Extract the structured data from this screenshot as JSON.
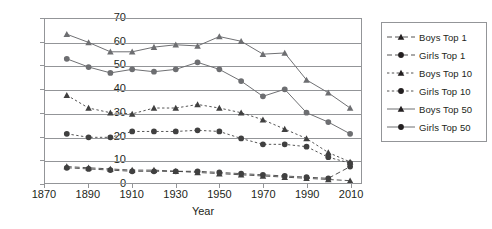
{
  "chart_data": {
    "type": "line",
    "title": "",
    "xlabel": "Year",
    "ylabel": "",
    "xlim": [
      1870,
      2015
    ],
    "ylim": [
      0,
      70
    ],
    "ytick_values": [
      0,
      10,
      20,
      30,
      40,
      50,
      60,
      70
    ],
    "xtick_values": [
      1870,
      1890,
      1910,
      1930,
      1950,
      1970,
      1990,
      2010
    ],
    "grid": "horizontal",
    "legend_position": "right",
    "x": [
      1880,
      1890,
      1900,
      1910,
      1920,
      1930,
      1940,
      1950,
      1960,
      1970,
      1980,
      1990,
      2000,
      2010
    ],
    "series": [
      {
        "name": "Boys Top 1",
        "marker": "triangle",
        "line_style": "dashed",
        "color": "#404040",
        "values": [
          7,
          6.5,
          6,
          5.5,
          5.5,
          5,
          4.5,
          4,
          3.5,
          3,
          2.5,
          2,
          1.5,
          1
        ]
      },
      {
        "name": "Girls Top 1",
        "marker": "circle",
        "line_style": "dashed",
        "color": "#404040",
        "values": [
          6.5,
          6,
          5.5,
          5,
          5,
          5,
          5,
          4.5,
          4,
          3.5,
          3,
          2.5,
          2,
          7
        ]
      },
      {
        "name": "Boys Top 10",
        "marker": "triangle",
        "line_style": "dotted",
        "color": "#404040",
        "values": [
          37.5,
          32,
          30,
          29.5,
          32,
          32,
          33.5,
          32,
          30,
          27,
          23,
          19,
          13,
          9
        ]
      },
      {
        "name": "Girls Top 10",
        "marker": "circle",
        "line_style": "dotted",
        "color": "#404040",
        "values": [
          21,
          19.5,
          19.5,
          22,
          22,
          22,
          22.5,
          22,
          19,
          16.5,
          16.5,
          15.5,
          11,
          8.5
        ]
      },
      {
        "name": "Boys Top 50",
        "marker": "triangle",
        "line_style": "solid",
        "color": "#6d6e71",
        "values": [
          63.5,
          60,
          56,
          56,
          58,
          59,
          58.5,
          62.5,
          60.5,
          55,
          55.5,
          44,
          38.5,
          32
        ]
      },
      {
        "name": "Girls Top 50",
        "marker": "circle",
        "line_style": "solid",
        "color": "#6d6e71",
        "values": [
          53,
          49.5,
          47,
          48.5,
          47.5,
          48.5,
          51.5,
          48.5,
          43.5,
          37,
          40,
          30,
          26,
          21
        ]
      }
    ]
  },
  "legend": {
    "items": [
      {
        "label": "Boys Top 1"
      },
      {
        "label": "Girls Top 1"
      },
      {
        "label": "Boys Top 10"
      },
      {
        "label": "Girls Top 10"
      },
      {
        "label": "Boys Top 50"
      },
      {
        "label": "Girls Top 50"
      }
    ]
  }
}
